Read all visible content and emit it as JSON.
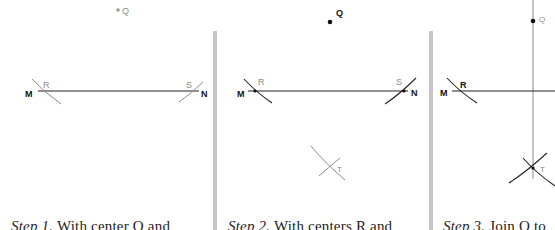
{
  "colors": {
    "ink": "#111111",
    "construction": "#9a9a9a",
    "label_light": "#8a8a8a",
    "divider": "#c4c4c4"
  },
  "panels": [
    {
      "id": "step1",
      "points": {
        "Q": "Q",
        "M": "M",
        "N": "N",
        "R": "R",
        "S": "S"
      },
      "caption": {
        "step": "Step 1.",
        "text": " With center Q and"
      }
    },
    {
      "id": "step2",
      "points": {
        "Q": "Q",
        "M": "M",
        "N": "N",
        "R": "R",
        "S": "S",
        "T": "T"
      },
      "caption": {
        "step": "Step 2.",
        "text": " With centers R and"
      }
    },
    {
      "id": "step3",
      "points": {
        "Q": "Q",
        "M": "M",
        "R": "R",
        "T": "T"
      },
      "caption": {
        "step": "Step 3.",
        "text": " Join Q to"
      }
    }
  ]
}
